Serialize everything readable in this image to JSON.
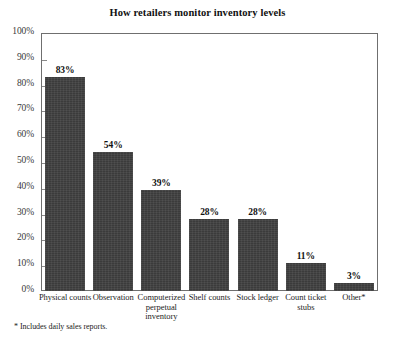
{
  "chart_data": {
    "type": "bar",
    "title": "How retailers monitor inventory levels",
    "xlabel": "",
    "ylabel": "",
    "ylim": [
      0,
      100
    ],
    "grid": false,
    "legend": null,
    "y_ticks": [
      "0%",
      "10%",
      "20%",
      "30%",
      "40%",
      "50%",
      "60%",
      "70%",
      "80%",
      "90%",
      "100%"
    ],
    "y_tick_values": [
      0,
      10,
      20,
      30,
      40,
      50,
      60,
      70,
      80,
      90,
      100
    ],
    "categories": [
      "Physical counts",
      "Observation",
      "Computerized perpetual inventory",
      "Shelf counts",
      "Stock ledger",
      "Count ticket stubs",
      "Other*"
    ],
    "values": [
      83,
      54,
      39,
      28,
      28,
      11,
      3
    ],
    "data_labels": [
      "83%",
      "54%",
      "39%",
      "28%",
      "28%",
      "11%",
      "3%"
    ],
    "annotations": [
      "* Includes daily sales reports."
    ],
    "bar_color": "#3b3b3b"
  },
  "footnote": "* Includes daily sales reports."
}
